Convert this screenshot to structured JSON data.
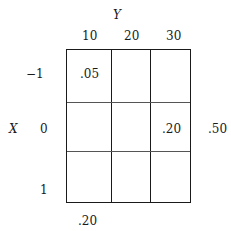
{
  "table": {
    "y_label": "Y",
    "x_label": "X",
    "columns": [
      "10",
      "20",
      "30"
    ],
    "rows": [
      "−1",
      "0",
      "1"
    ],
    "cells": [
      [
        ".05",
        "",
        ""
      ],
      [
        "",
        "",
        ".20"
      ],
      [
        "",
        "",
        ""
      ]
    ],
    "row_marginals": [
      "",
      ".50",
      ""
    ],
    "column_marginals": [
      ".20",
      "",
      ""
    ]
  }
}
